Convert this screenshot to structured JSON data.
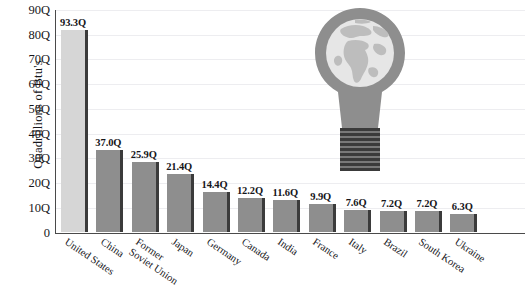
{
  "chart_data": {
    "type": "bar",
    "title": "",
    "subtitle": "",
    "xlabel": "",
    "ylabel": "Quadrillions of Btu's",
    "ylim": [
      0,
      90
    ],
    "ytick_labels": [
      "90Q",
      "80Q",
      "70Q",
      "60Q",
      "50Q",
      "40Q",
      "30Q",
      "20Q",
      "10Q",
      "0"
    ],
    "ytick_values": [
      90,
      80,
      70,
      60,
      50,
      40,
      30,
      20,
      10,
      0
    ],
    "grid": true,
    "legend": null,
    "categories": [
      "United States",
      "China",
      "Former Soviet Union",
      "Japan",
      "Germany",
      "Canada",
      "India",
      "France",
      "Italy",
      "Brazil",
      "South Korea",
      "Ukraine"
    ],
    "values": [
      93.3,
      37.0,
      25.9,
      21.4,
      14.4,
      12.2,
      11.6,
      9.9,
      7.6,
      7.2,
      7.2,
      6.3
    ],
    "data_labels": [
      "93.3Q",
      "37.0Q",
      "25.9Q",
      "21.4Q",
      "14.4Q",
      "12.2Q",
      "11.6Q",
      "9.9Q",
      "7.6Q",
      "7.2Q",
      "7.2Q",
      "6.3Q"
    ],
    "drawn_heights": [
      81.5,
      32.8,
      28.3,
      23.2,
      16.1,
      13.6,
      12.9,
      11.2,
      8.6,
      8.2,
      8.2,
      7.2
    ],
    "category_lines": [
      [
        "United States"
      ],
      [
        "China"
      ],
      [
        "Former",
        "Soviet Union"
      ],
      [
        "Japan"
      ],
      [
        "Germany"
      ],
      [
        "Canada"
      ],
      [
        "India"
      ],
      [
        "France"
      ],
      [
        "Italy"
      ],
      [
        "Brazil"
      ],
      [
        "South Korea"
      ],
      [
        "Ukraine"
      ]
    ],
    "colors": {
      "first_bar": "#d6d6d6",
      "bars": "#8e8e8e",
      "bar_edge": "#3b3b3b",
      "axis": "#4a4a4a",
      "gridline": "#ededf0",
      "text": "#16161a",
      "bulb_body": "#8e8e8e",
      "bulb_glass": "#e3e3e3",
      "bulb_land": "#b8b8b8",
      "bulb_base": "#3a3a3a",
      "background": "#ffffff"
    }
  },
  "graphic": {
    "name": "globe-lightbulb",
    "description": "Light bulb containing a globe showing Africa and Europe"
  }
}
